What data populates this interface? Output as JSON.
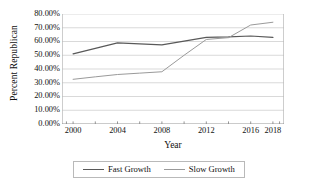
{
  "chart_data": {
    "type": "line",
    "title": "",
    "xlabel": "Year",
    "ylabel": "Percent Republican",
    "x": [
      2000,
      2002,
      2004,
      2006,
      2008,
      2010,
      2012,
      2014,
      2016,
      2018
    ],
    "xlim": [
      1999,
      2019
    ],
    "ylim": [
      0,
      80
    ],
    "ytick_labels": [
      "0.00%",
      "10.00%",
      "20.00%",
      "30.00%",
      "40.00%",
      "50.00%",
      "60.00%",
      "70.00%",
      "80.00%"
    ],
    "ytick_values": [
      0,
      10,
      20,
      30,
      40,
      50,
      60,
      70,
      80
    ],
    "xtick_labels": [
      "2000",
      "2004",
      "2008",
      "2012",
      "2016",
      "2018"
    ],
    "xtick_values": [
      2000,
      2004,
      2008,
      2012,
      2016,
      2018
    ],
    "xtick_minor_values": [
      2002,
      2006,
      2010,
      2014
    ],
    "grid": true,
    "grid_axis": "y",
    "legend_position": "bottom",
    "series": [
      {
        "name": "Fast Growth",
        "color": "#595959",
        "values": [
          51.0,
          55.0,
          59.0,
          58.2,
          57.5,
          60.3,
          63.0,
          63.3,
          64.0,
          63.0
        ]
      },
      {
        "name": "Slow Growth",
        "color": "#9a9a9a",
        "values": [
          32.5,
          34.3,
          36.0,
          37.0,
          38.0,
          50.0,
          61.5,
          62.8,
          72.0,
          74.0
        ]
      }
    ]
  },
  "axes": {
    "y_title": "Percent Republican",
    "x_title": "Year"
  },
  "legend": {
    "entries": [
      {
        "label": "Fast Growth",
        "color": "#595959"
      },
      {
        "label": "Slow Growth",
        "color": "#9a9a9a"
      }
    ]
  },
  "colors": {
    "grid": "#c8c8c8",
    "axis": "#8a8a8a",
    "plot_border": "#b9b9b9",
    "text": "#111111",
    "background": "#ffffff"
  }
}
